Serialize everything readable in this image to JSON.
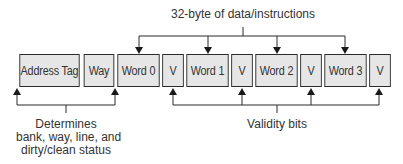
{
  "diagram": {
    "top_label": "32-byte of data/instructions",
    "cells": [
      {
        "label": "Address Tag",
        "kind": "tag"
      },
      {
        "label": "Way",
        "kind": "tag"
      },
      {
        "label": "Word 0",
        "kind": "word"
      },
      {
        "label": "V",
        "kind": "valid"
      },
      {
        "label": "Word 1",
        "kind": "word"
      },
      {
        "label": "V",
        "kind": "valid"
      },
      {
        "label": "Word 2",
        "kind": "word"
      },
      {
        "label": "V",
        "kind": "valid"
      },
      {
        "label": "Word 3",
        "kind": "word"
      },
      {
        "label": "V",
        "kind": "valid"
      }
    ],
    "left_label_lines": [
      "Determines",
      "bank, way, line, and",
      "dirty/clean status"
    ],
    "right_label": "Validity bits",
    "colors": {
      "cell_fill": "#e6e6e6",
      "line": "#2a2a2a",
      "text": "#333333"
    }
  }
}
